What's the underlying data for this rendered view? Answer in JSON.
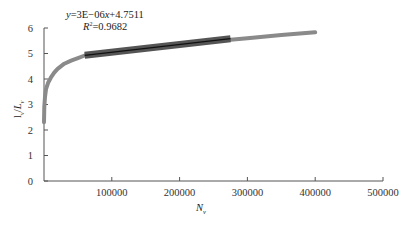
{
  "chart_data": {
    "type": "line",
    "title": "",
    "xlabel": "N_v",
    "ylabel": "l_v/L_v",
    "xlim": [
      0,
      500000
    ],
    "ylim": [
      0,
      6
    ],
    "xticks": [
      100000,
      200000,
      300000,
      400000,
      500000
    ],
    "xtick_labels": [
      "100000",
      "200000",
      "300000",
      "400000",
      "500000"
    ],
    "yticks": [
      0,
      1,
      2,
      3,
      4,
      5,
      6
    ],
    "ytick_labels": [
      "0",
      "1",
      "2",
      "3",
      "4",
      "5",
      "6"
    ],
    "grid": false,
    "legend": null,
    "series": [
      {
        "name": "data",
        "color": "#8a8a8a",
        "x": [
          0,
          500,
          1500,
          3000,
          6000,
          10000,
          15000,
          20000,
          30000,
          40000,
          50000,
          60000,
          80000,
          100000,
          150000,
          200000,
          250000,
          275000,
          300000,
          350000,
          400000
        ],
        "y": [
          2.3,
          2.9,
          3.3,
          3.6,
          3.85,
          4.05,
          4.25,
          4.4,
          4.6,
          4.72,
          4.82,
          4.92,
          5.0,
          5.07,
          5.22,
          5.36,
          5.49,
          5.54,
          5.6,
          5.72,
          5.83
        ]
      },
      {
        "name": "linear-fit-segment",
        "color": "#3a3a3a",
        "x": [
          60000,
          275000
        ],
        "y": [
          4.93,
          5.58
        ]
      }
    ],
    "annotations": [
      {
        "text_parts": [
          "y",
          "=3E−06",
          "x",
          "+4.7511"
        ],
        "role": "fit-equation"
      },
      {
        "text_parts": [
          "R",
          "2",
          "=0.9682"
        ],
        "role": "r-squared"
      }
    ]
  },
  "labels": {
    "eq_y": "y",
    "eq_mid": "=3E−06",
    "eq_x": "x",
    "eq_end": "+4.7511",
    "r_R": "R",
    "r_sup": "2",
    "r_val": "=0.9682",
    "xlabel_main": "N",
    "xlabel_sub": "v",
    "ylabel_l": "l",
    "ylabel_lsub": "v",
    "ylabel_slash": "/",
    "ylabel_L": "L",
    "ylabel_Lsub": "v"
  }
}
